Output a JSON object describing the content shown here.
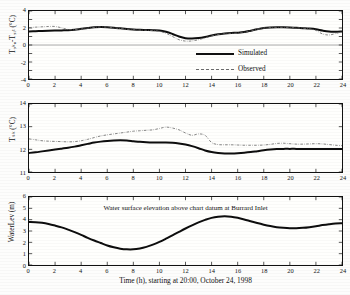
{
  "figure": {
    "background": "#fdfdfc",
    "ink": "#111111",
    "observed_color": "#707070",
    "simulated_color": "#0d0d0d"
  },
  "legend": {
    "entries": [
      {
        "label": "Simulated",
        "style": "solid-thick",
        "color": "#0d0d0d"
      },
      {
        "label": "Observed",
        "style": "dash-dot-thin",
        "color": "#707070"
      }
    ]
  },
  "axis": {
    "x_ticks": [
      "0",
      "2",
      "4",
      "6",
      "8",
      "10",
      "12",
      "14",
      "16",
      "18",
      "20",
      "22",
      "24"
    ],
    "x_label": "Time (h), starting at 20:00, October 24, 1998",
    "panel1_y_ticks": [
      "4",
      "2",
      "0",
      "-2",
      "-4"
    ],
    "panel2_y_ticks": [
      "14",
      "13",
      "12",
      "11"
    ],
    "panel3_y_ticks": [
      "6",
      "5",
      "4",
      "3",
      "2",
      "1",
      "0"
    ],
    "panel1_y_label": "T₉ₖₒ-T₉ᵢₜ (°C)",
    "panel2_y_label": "Tₛₖ (°C)",
    "panel3_y_label": "WaterLev (m)"
  },
  "annotations": {
    "panel3_text": "Water surface elevation above chart datum at Burrard Inlet"
  },
  "chart_data": [
    {
      "type": "line",
      "title": "",
      "xlabel": "",
      "ylabel": "T₉ₖₒ-T₉ᵢₜ (°C)",
      "xlim": [
        0,
        24
      ],
      "ylim": [
        -4,
        4
      ],
      "grid": false,
      "legend_position": "center-right-inside",
      "reference_lines": [
        {
          "y": 0,
          "color": "#8a8a8a"
        }
      ],
      "x": [
        0,
        0.5,
        1,
        1.5,
        2,
        2.5,
        3,
        3.5,
        4,
        4.5,
        5,
        5.5,
        6,
        6.5,
        7,
        7.5,
        8,
        8.5,
        9,
        9.5,
        10,
        10.5,
        11,
        11.5,
        12,
        12.5,
        13,
        13.5,
        14,
        14.5,
        15,
        15.5,
        16,
        16.5,
        17,
        17.5,
        18,
        18.5,
        19,
        19.5,
        20,
        20.5,
        21,
        21.5,
        22,
        22.5,
        23,
        23.5,
        24
      ],
      "series": [
        {
          "name": "Simulated",
          "values": [
            1.6,
            1.62,
            1.65,
            1.68,
            1.7,
            1.72,
            1.74,
            1.8,
            1.9,
            2.0,
            2.08,
            2.12,
            2.1,
            2.04,
            1.96,
            1.88,
            1.82,
            1.78,
            1.76,
            1.74,
            1.7,
            1.55,
            1.3,
            1.0,
            0.8,
            0.76,
            0.82,
            0.95,
            1.12,
            1.26,
            1.36,
            1.42,
            1.45,
            1.52,
            1.68,
            1.86,
            2.0,
            2.06,
            2.08,
            2.08,
            2.06,
            2.02,
            1.98,
            1.94,
            1.86,
            1.7,
            1.58,
            1.56,
            1.6
          ]
        },
        {
          "name": "Observed",
          "values": [
            2.05,
            2.1,
            2.14,
            2.18,
            2.18,
            2.02,
            1.82,
            1.8,
            1.88,
            1.98,
            2.06,
            2.12,
            2.1,
            2.02,
            1.94,
            1.86,
            1.8,
            1.76,
            1.74,
            1.7,
            1.6,
            1.38,
            1.0,
            0.62,
            0.46,
            0.48,
            0.62,
            0.84,
            1.06,
            1.22,
            1.32,
            1.38,
            1.4,
            1.48,
            1.66,
            1.86,
            2.0,
            2.06,
            2.08,
            2.08,
            2.06,
            2.02,
            1.98,
            1.9,
            1.72,
            1.3,
            1.18,
            1.34,
            1.58
          ]
        }
      ]
    },
    {
      "type": "line",
      "title": "",
      "xlabel": "",
      "ylabel": "Tₛₖ (°C)",
      "xlim": [
        0,
        24
      ],
      "ylim": [
        11,
        14
      ],
      "grid": false,
      "x": [
        0,
        0.5,
        1,
        1.5,
        2,
        2.5,
        3,
        3.5,
        4,
        4.5,
        5,
        5.5,
        6,
        6.5,
        7,
        7.5,
        8,
        8.5,
        9,
        9.5,
        10,
        10.5,
        11,
        11.5,
        12,
        12.5,
        13,
        13.5,
        14,
        14.5,
        15,
        15.5,
        16,
        16.5,
        17,
        17.5,
        18,
        18.5,
        19,
        19.5,
        20,
        20.5,
        21,
        21.5,
        22,
        22.5,
        23,
        23.5,
        24
      ],
      "series": [
        {
          "name": "Simulated",
          "values": [
            11.84,
            11.87,
            11.91,
            11.95,
            11.99,
            12.03,
            12.07,
            12.12,
            12.18,
            12.24,
            12.3,
            12.34,
            12.37,
            12.39,
            12.4,
            12.39,
            12.36,
            12.33,
            12.31,
            12.3,
            12.3,
            12.3,
            12.29,
            12.26,
            12.21,
            12.14,
            12.05,
            11.95,
            11.88,
            11.84,
            11.82,
            11.82,
            11.83,
            11.85,
            11.88,
            11.92,
            11.96,
            11.99,
            12.01,
            12.02,
            12.02,
            12.02,
            12.01,
            12.01,
            12.01,
            12.01,
            12.01,
            12.01,
            12.02
          ]
        },
        {
          "name": "Observed",
          "values": [
            12.46,
            12.42,
            12.38,
            12.36,
            12.35,
            12.34,
            12.33,
            12.34,
            12.38,
            12.44,
            12.52,
            12.59,
            12.64,
            12.68,
            12.72,
            12.76,
            12.8,
            12.82,
            12.84,
            12.86,
            12.92,
            12.98,
            12.94,
            12.86,
            12.72,
            12.62,
            12.68,
            12.62,
            12.3,
            12.21,
            12.2,
            12.2,
            12.19,
            12.18,
            12.18,
            12.18,
            12.19,
            12.22,
            12.26,
            12.27,
            12.25,
            12.23,
            12.23,
            12.24,
            12.25,
            12.24,
            12.21,
            12.18,
            12.16
          ]
        }
      ]
    },
    {
      "type": "line",
      "title": "Water surface elevation above chart datum at Burrard Inlet",
      "xlabel": "Time (h), starting at 20:00, October 24, 1998",
      "ylabel": "WaterLev (m)",
      "xlim": [
        0,
        24
      ],
      "ylim": [
        0,
        6
      ],
      "grid": false,
      "x": [
        0,
        0.5,
        1,
        1.5,
        2,
        2.5,
        3,
        3.5,
        4,
        4.5,
        5,
        5.5,
        6,
        6.5,
        7,
        7.5,
        8,
        8.5,
        9,
        9.5,
        10,
        10.5,
        11,
        11.5,
        12,
        12.5,
        13,
        13.5,
        14,
        14.5,
        15,
        15.5,
        16,
        16.5,
        17,
        17.5,
        18,
        18.5,
        19,
        19.5,
        20,
        20.5,
        21,
        21.5,
        22,
        22.5,
        23,
        23.5,
        24
      ],
      "series": [
        {
          "name": "Water level",
          "values": [
            3.8,
            3.78,
            3.72,
            3.62,
            3.48,
            3.32,
            3.12,
            2.9,
            2.66,
            2.4,
            2.16,
            1.94,
            1.72,
            1.56,
            1.44,
            1.38,
            1.38,
            1.46,
            1.6,
            1.8,
            2.04,
            2.32,
            2.62,
            2.92,
            3.22,
            3.5,
            3.76,
            3.98,
            4.16,
            4.26,
            4.3,
            4.26,
            4.16,
            4.02,
            3.86,
            3.7,
            3.56,
            3.44,
            3.34,
            3.28,
            3.24,
            3.24,
            3.28,
            3.34,
            3.42,
            3.52,
            3.6,
            3.66,
            3.68
          ]
        }
      ]
    }
  ]
}
